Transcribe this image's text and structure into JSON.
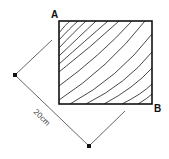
{
  "diagram": {
    "corner_labels": {
      "top_left": "A",
      "bottom_right": "B"
    },
    "dimension_label": "20cm",
    "shape": "rectangle with concentric arc contour lines radiating from corner A",
    "colors": {
      "stroke": "#111111",
      "dimension_line": "#555555",
      "background": "#ffffff"
    }
  }
}
